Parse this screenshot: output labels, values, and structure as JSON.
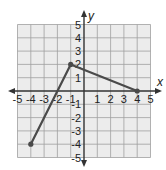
{
  "chart_data": {
    "type": "line",
    "title": "",
    "xlabel": "x",
    "ylabel": "y",
    "xlim": [
      -5,
      5
    ],
    "ylim": [
      -5,
      5
    ],
    "grid": true,
    "x_ticks": [
      -5,
      -4,
      -3,
      -2,
      -1,
      1,
      2,
      3,
      4,
      5
    ],
    "y_ticks": [
      5,
      4,
      3,
      2,
      1,
      -1,
      -2,
      -3,
      -4,
      -5
    ],
    "series": [
      {
        "name": "piecewise",
        "points": [
          [
            -4,
            -4
          ],
          [
            -1,
            2
          ],
          [
            4,
            0
          ]
        ],
        "markers": true
      }
    ],
    "colors": {
      "grid_bg": "#ececec",
      "grid_line": "#a0a0a0",
      "axis": "#333333",
      "line": "#4a4a4a",
      "marker": "#4a4a4a"
    }
  }
}
